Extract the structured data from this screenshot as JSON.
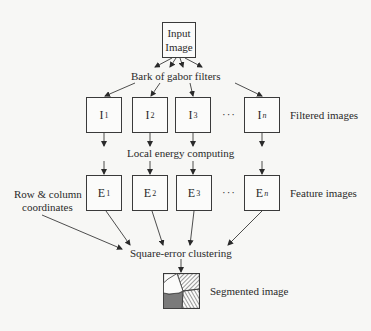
{
  "input": {
    "line1": "Input",
    "line2": "Image"
  },
  "labels": {
    "filter_bank": "Bark of gabor filters",
    "local_energy": "Local energy computing",
    "filtered_images": "Filtered images",
    "feature_images": "Feature images",
    "row_col_line1": "Row & column",
    "row_col_line2": "coordinates",
    "clustering": "Square-error clustering",
    "segmented": "Segmented image",
    "ellipsis": "···"
  },
  "filtered": [
    {
      "base": "I",
      "sub": "1"
    },
    {
      "base": "I",
      "sub": "2"
    },
    {
      "base": "I",
      "sub": "3"
    },
    {
      "base": "I",
      "sub": "n"
    }
  ],
  "features": [
    {
      "base": "E",
      "sub": "1"
    },
    {
      "base": "E",
      "sub": "2"
    },
    {
      "base": "E",
      "sub": "3"
    },
    {
      "base": "E",
      "sub": "n"
    }
  ],
  "colors": {
    "line": "#3a3a3a",
    "dark_fill": "#7a7a7a"
  }
}
